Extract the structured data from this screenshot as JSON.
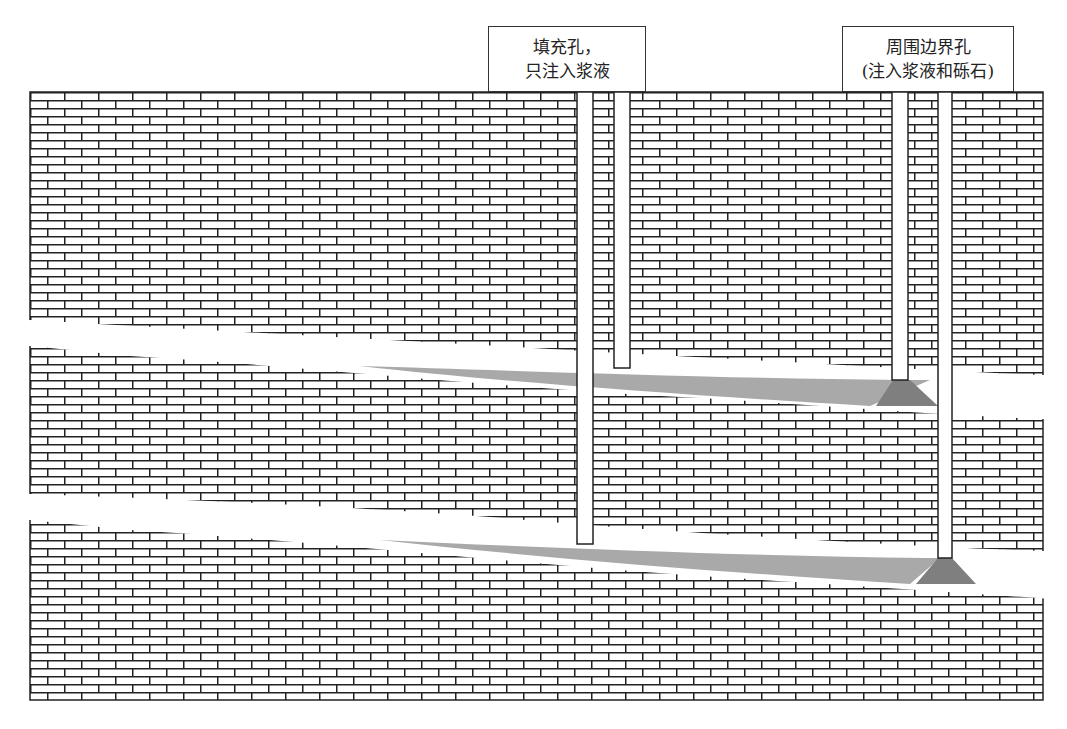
{
  "diagram": {
    "type": "grouting cross-section",
    "labels": {
      "fill_hole": {
        "line1": "填充孔，",
        "line2": "只注入浆液"
      },
      "perimeter_hole": {
        "line1": "周围边界孔",
        "line2": "(注入浆液和砾石)"
      }
    },
    "colors": {
      "brick_line": "#222222",
      "brick_face": "#ffffff",
      "grout": "#a9a9a9",
      "gravel_cone": "#7f7f7f",
      "void": "#ffffff"
    },
    "elements": {
      "rock_mass": "brick-pattern strata",
      "voids": [
        "upper void seam",
        "lower void seam"
      ],
      "boreholes": [
        "fill hole pair (left)",
        "perimeter hole pair (right)"
      ],
      "grout_fills": [
        "upper grout wedge",
        "lower grout wedge"
      ],
      "gravel_cones": [
        "upper gravel cone",
        "lower gravel cone"
      ]
    }
  }
}
